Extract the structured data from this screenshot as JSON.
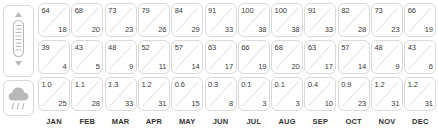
{
  "chart_data": {
    "type": "table",
    "categories": [
      "JAN",
      "FEB",
      "MAR",
      "APR",
      "MAY",
      "JUN",
      "JUL",
      "AUG",
      "SEP",
      "OCT",
      "NOV",
      "DEC"
    ],
    "rows": [
      {
        "row_icon": "thermometer-icon",
        "row_name": "high-temperature",
        "series": [
          {
            "name": "high-f",
            "values": [
              64,
              68,
              73,
              79,
              84,
              91,
              100,
              100,
              91,
              82,
              73,
              66
            ]
          },
          {
            "name": "high-c",
            "values": [
              18,
              20,
              23,
              26,
              29,
              33,
              38,
              38,
              33,
              28,
              23,
              19
            ]
          }
        ]
      },
      {
        "row_icon": "thermometer-icon",
        "row_name": "low-temperature",
        "series": [
          {
            "name": "low-f",
            "values": [
              39,
              43,
              48,
              52,
              57,
              63,
              66,
              68,
              63,
              57,
              48,
              43
            ]
          },
          {
            "name": "low-c",
            "values": [
              4,
              5,
              9,
              11,
              14,
              17,
              19,
              20,
              17,
              14,
              9,
              6
            ]
          }
        ]
      },
      {
        "row_icon": "rain-cloud-icon",
        "row_name": "precipitation",
        "series": [
          {
            "name": "precip-in",
            "values": [
              "1.0",
              "1.1",
              "1.3",
              "1.2",
              "0.6",
              "0.3",
              "0.1",
              "0.1",
              "0.4",
              "0.9",
              "1.2",
              "1.2"
            ]
          },
          {
            "name": "precip-mm",
            "values": [
              25,
              28,
              33,
              31,
              15,
              8,
              3,
              3,
              10,
              23,
              31,
              31
            ]
          }
        ]
      }
    ]
  },
  "months": [
    {
      "label": "JAN",
      "high": {
        "primary": "64",
        "secondary": "18"
      },
      "low": {
        "primary": "39",
        "secondary": "4"
      },
      "precip": {
        "primary": "1.0",
        "secondary": "25"
      }
    },
    {
      "label": "FEB",
      "high": {
        "primary": "68",
        "secondary": "20"
      },
      "low": {
        "primary": "43",
        "secondary": "5"
      },
      "precip": {
        "primary": "1.1",
        "secondary": "28"
      }
    },
    {
      "label": "MAR",
      "high": {
        "primary": "73",
        "secondary": "23"
      },
      "low": {
        "primary": "48",
        "secondary": "9"
      },
      "precip": {
        "primary": "1.3",
        "secondary": "33"
      }
    },
    {
      "label": "APR",
      "high": {
        "primary": "79",
        "secondary": "26"
      },
      "low": {
        "primary": "52",
        "secondary": "11"
      },
      "precip": {
        "primary": "1.2",
        "secondary": "31"
      }
    },
    {
      "label": "MAY",
      "high": {
        "primary": "84",
        "secondary": "29"
      },
      "low": {
        "primary": "57",
        "secondary": "14"
      },
      "precip": {
        "primary": "0.6",
        "secondary": "15"
      }
    },
    {
      "label": "JUN",
      "high": {
        "primary": "91",
        "secondary": "33"
      },
      "low": {
        "primary": "63",
        "secondary": "17"
      },
      "precip": {
        "primary": "0.3",
        "secondary": "8"
      }
    },
    {
      "label": "JUL",
      "high": {
        "primary": "100",
        "secondary": "38"
      },
      "low": {
        "primary": "66",
        "secondary": "19"
      },
      "precip": {
        "primary": "0.1",
        "secondary": "3"
      }
    },
    {
      "label": "AUG",
      "high": {
        "primary": "100",
        "secondary": "38"
      },
      "low": {
        "primary": "68",
        "secondary": "20"
      },
      "precip": {
        "primary": "0.1",
        "secondary": "3"
      }
    },
    {
      "label": "SEP",
      "high": {
        "primary": "91",
        "secondary": "33"
      },
      "low": {
        "primary": "63",
        "secondary": "17"
      },
      "precip": {
        "primary": "0.4",
        "secondary": "10"
      }
    },
    {
      "label": "OCT",
      "high": {
        "primary": "82",
        "secondary": "28"
      },
      "low": {
        "primary": "57",
        "secondary": "14"
      },
      "precip": {
        "primary": "0.9",
        "secondary": "23"
      }
    },
    {
      "label": "NOV",
      "high": {
        "primary": "73",
        "secondary": "23"
      },
      "low": {
        "primary": "48",
        "secondary": "9"
      },
      "precip": {
        "primary": "1.2",
        "secondary": "31"
      }
    },
    {
      "label": "DEC",
      "high": {
        "primary": "66",
        "secondary": "19"
      },
      "low": {
        "primary": "43",
        "secondary": "6"
      },
      "precip": {
        "primary": "1.2",
        "secondary": "31"
      }
    }
  ],
  "row_icons": {
    "temperature": "thermometer-icon",
    "precipitation": "rain-cloud-icon"
  },
  "colors": {
    "border": "#d9d9d9",
    "text": "#3a3a3a",
    "label": "#333333",
    "icon": "#b0b0b0",
    "background": "#ffffff"
  }
}
